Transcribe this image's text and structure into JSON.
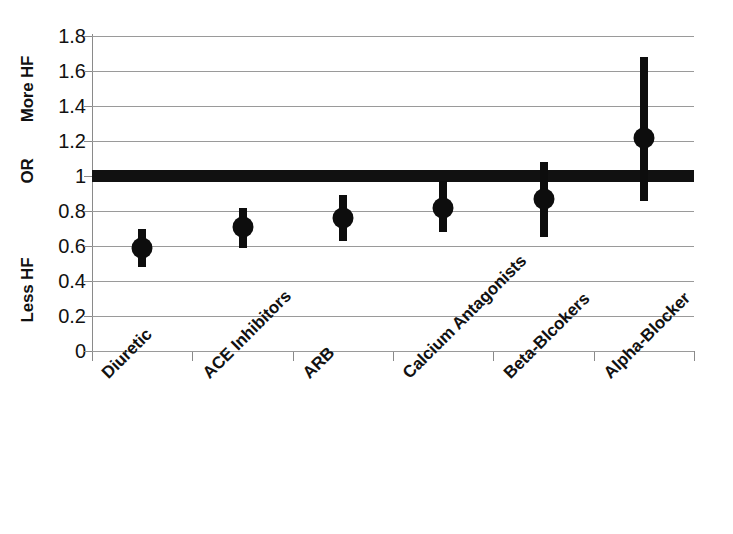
{
  "chart_data": {
    "type": "scatter",
    "subtype": "forest-plot",
    "title": "",
    "xlabel": "",
    "ylabel": "OR",
    "ylim": [
      0,
      1.8
    ],
    "grid": true,
    "legend": false,
    "categories": [
      "Diuretic",
      "ACE Inhibitors",
      "ARB",
      "Calcium Antagonists",
      "Beta-Blcokers",
      "Alpha-Blocker"
    ],
    "values": [
      0.59,
      0.71,
      0.76,
      0.82,
      0.87,
      1.22
    ],
    "ci_lower": [
      0.48,
      0.59,
      0.63,
      0.68,
      0.65,
      0.86
    ],
    "ci_upper": [
      0.7,
      0.82,
      0.89,
      0.97,
      1.08,
      1.68
    ],
    "series": [
      {
        "name": "Odds Ratio",
        "points": [
          {
            "category": "Diuretic",
            "or": 0.59,
            "ci_low": 0.48,
            "ci_high": 0.7
          },
          {
            "category": "ACE Inhibitors",
            "or": 0.71,
            "ci_low": 0.59,
            "ci_high": 0.82
          },
          {
            "category": "ARB",
            "or": 0.76,
            "ci_low": 0.63,
            "ci_high": 0.89
          },
          {
            "category": "Calcium Antagonists",
            "or": 0.82,
            "ci_low": 0.68,
            "ci_high": 0.97
          },
          {
            "category": "Beta-Blcokers",
            "or": 0.87,
            "ci_low": 0.65,
            "ci_high": 1.08
          },
          {
            "category": "Alpha-Blocker",
            "or": 1.22,
            "ci_low": 0.86,
            "ci_high": 1.68
          }
        ]
      }
    ],
    "reference_line": {
      "value": 1,
      "label": "OR",
      "style": "thick-solid",
      "color": "#111111"
    },
    "y_ticks": [
      0,
      0.2,
      0.4,
      0.6,
      0.8,
      1,
      1.2,
      1.4,
      1.6,
      1.8
    ],
    "y_tick_labels": [
      "0",
      "0.2",
      "0.4",
      "0.6",
      "0.8",
      "1",
      "1.2",
      "1.4",
      "1.6",
      "1.8"
    ],
    "axis_annotations": [
      {
        "name": "more-hf",
        "text": "More HF",
        "position": "y-upper"
      },
      {
        "name": "or",
        "text": "OR",
        "position": "y-middle"
      },
      {
        "name": "less-hf",
        "text": "Less HF",
        "position": "y-lower"
      }
    ],
    "colors": {
      "marker": "#0d0d0d",
      "ci": "#0d0d0d",
      "gridline": "#9a9a9a",
      "axis": "#8a8a8a",
      "reference": "#111111",
      "background": "#ffffff"
    }
  }
}
